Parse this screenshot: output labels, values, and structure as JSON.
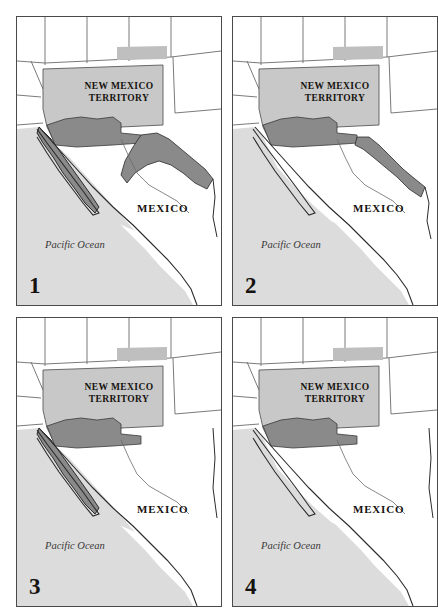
{
  "figure": {
    "panel_count": 4,
    "columns": 2,
    "rows": 2
  },
  "colors": {
    "ocean": "#dcdcdc",
    "land": "#ffffff",
    "territory_fill": "#c8c8c8",
    "acquisition_fill": "#8a8a8a",
    "upper_territory_fill": "#bfbfbf",
    "border_line": "#4a4a4a",
    "coast_line": "#2b2b2b",
    "state_line": "#6b6b6b",
    "text": "#15120f",
    "ocean_text": "#3a3a3a"
  },
  "labels": {
    "territory_line1": "NEW MEXICO",
    "territory_line2": "TERRITORY",
    "mexico": "MEXICO",
    "ocean": "Pacific Ocean"
  },
  "panels": [
    {
      "number": "1",
      "name": "panel-1",
      "territory_label_line1": "NEW MEXICO",
      "territory_label_line2": "TERRITORY",
      "mexico_label": "MEXICO",
      "ocean_label": "Pacific Ocean",
      "shaded_regions": [
        "gadsden-strip",
        "baja-california",
        "northern-mexico-band"
      ],
      "has_baja_shading": true,
      "has_eastern_band": true,
      "eastern_band_size": "large"
    },
    {
      "number": "2",
      "name": "panel-2",
      "territory_label_line1": "NEW MEXICO",
      "territory_label_line2": "TERRITORY",
      "mexico_label": "MEXICO",
      "ocean_label": "Pacific Ocean",
      "shaded_regions": [
        "gadsden-strip",
        "northern-mexico-band"
      ],
      "has_baja_shading": false,
      "has_eastern_band": true,
      "eastern_band_size": "narrow"
    },
    {
      "number": "3",
      "name": "panel-3",
      "territory_label_line1": "NEW MEXICO",
      "territory_label_line2": "TERRITORY",
      "mexico_label": "MEXICO",
      "ocean_label": "Pacific Ocean",
      "shaded_regions": [
        "gadsden-strip",
        "baja-california"
      ],
      "has_baja_shading": true,
      "has_eastern_band": false,
      "eastern_band_size": "none"
    },
    {
      "number": "4",
      "name": "panel-4",
      "territory_label_line1": "NEW MEXICO",
      "territory_label_line2": "TERRITORY",
      "mexico_label": "MEXICO",
      "ocean_label": "Pacific Ocean",
      "shaded_regions": [
        "gadsden-strip"
      ],
      "has_baja_shading": false,
      "has_eastern_band": false,
      "eastern_band_size": "none"
    }
  ]
}
